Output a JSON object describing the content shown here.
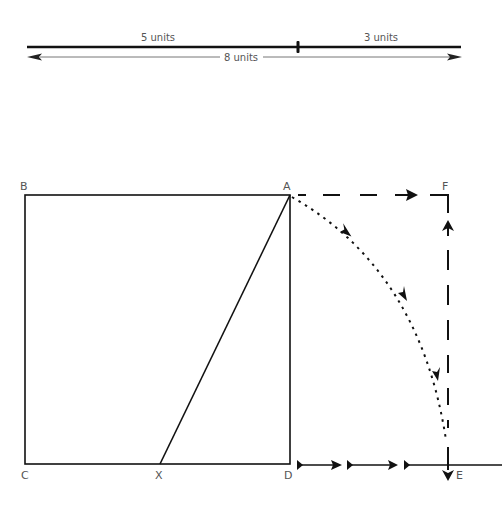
{
  "scale_bar": {
    "segment1_label": "5 units",
    "segment2_label": "3 units",
    "total_label": "8 units"
  },
  "figure": {
    "points": {
      "A": "A",
      "B": "B",
      "C": "C",
      "D": "D",
      "E": "E",
      "F": "F",
      "X": "X"
    }
  },
  "colors": {
    "stroke": "#111111",
    "label": "#555555",
    "thin": "#777777"
  }
}
